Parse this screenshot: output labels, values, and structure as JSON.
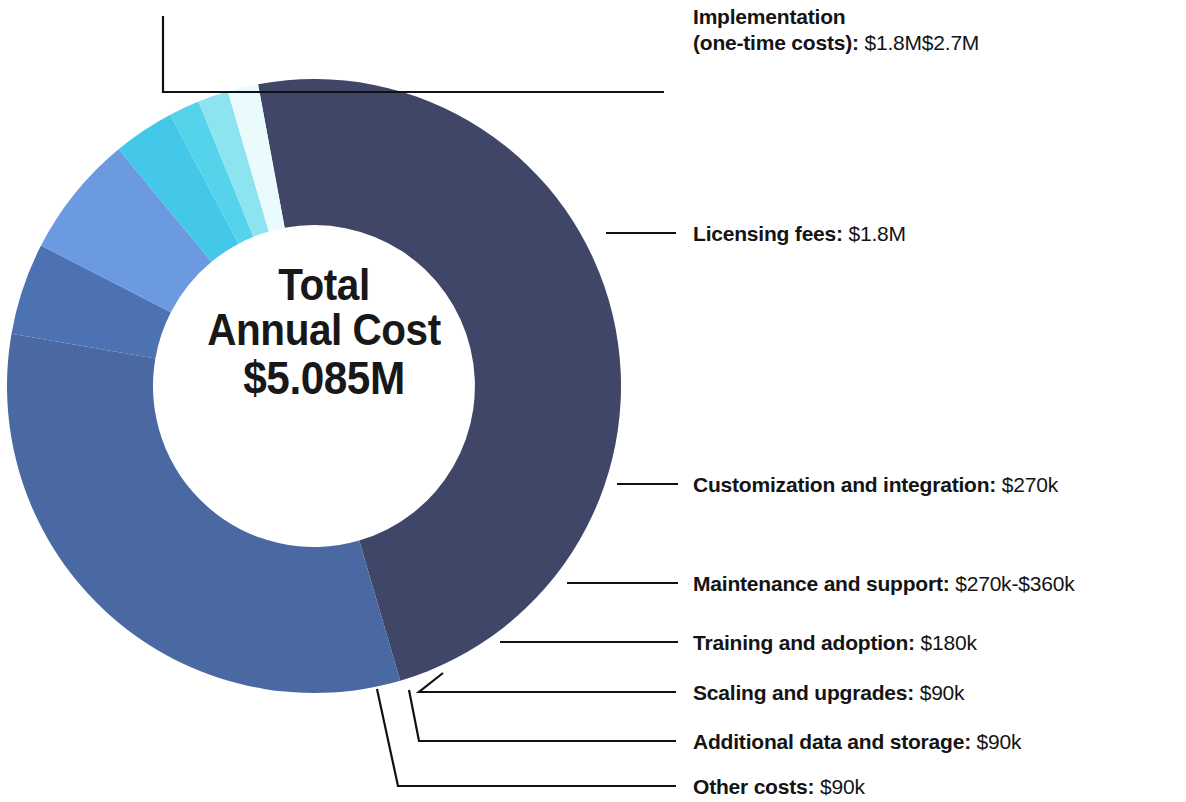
{
  "chart_data": {
    "type": "pie",
    "variant": "donut",
    "title": "Total Annual Cost",
    "center_label_line1": "Total",
    "center_label_line2": "Annual Cost",
    "center_value": "$5.085M",
    "total": 5.085,
    "total_unit": "M USD",
    "legend_position": "right-callouts",
    "grid": false,
    "categories": [
      "Implementation (one-time costs)",
      "Licensing fees",
      "Customization and integration",
      "Maintenance and support",
      "Training and adoption",
      "Scaling and upgrades",
      "Additional data and storage",
      "Other costs"
    ],
    "values": [
      2.7,
      1.8,
      0.27,
      0.36,
      0.18,
      0.09,
      0.09,
      0.09
    ],
    "value_labels": [
      "$1.8M$2.7M",
      "$1.8M",
      "$270k",
      "$270k-$360k",
      "$180k",
      "$90k",
      "$90k",
      "$90k"
    ],
    "colors": [
      "#3f4667",
      "#4a69a2",
      "#4c72b4",
      "#6b9ae0",
      "#43c8ea",
      "#55d3ea",
      "#8ce4f0",
      "#e9fbfd"
    ],
    "slices": [
      {
        "name": "Implementation (one-time costs)",
        "value_label": "$1.8M$2.7M",
        "value": 2.7,
        "percent": 53.1,
        "color": "#3f4667"
      },
      {
        "name": "Licensing fees",
        "value_label": "$1.8M",
        "value": 1.8,
        "percent": 35.4,
        "color": "#4a69a2"
      },
      {
        "name": "Customization and integration",
        "value_label": "$270k",
        "value": 0.27,
        "percent": 5.3,
        "color": "#4c72b4"
      },
      {
        "name": "Maintenance and support",
        "value_label": "$270k-$360k",
        "value": 0.36,
        "percent": 7.1,
        "color": "#6b9ae0"
      },
      {
        "name": "Training and adoption",
        "value_label": "$180k",
        "value": 0.18,
        "percent": 3.5,
        "color": "#43c8ea"
      },
      {
        "name": "Scaling and upgrades",
        "value_label": "$90k",
        "value": 0.09,
        "percent": 1.8,
        "color": "#55d3ea"
      },
      {
        "name": "Additional data and storage",
        "value_label": "$90k",
        "value": 0.09,
        "percent": 1.8,
        "color": "#8ce4f0"
      },
      {
        "name": "Other costs",
        "value_label": "$90k",
        "value": 0.09,
        "percent": 1.8,
        "color": "#e9fbfd"
      }
    ]
  },
  "callouts": {
    "implementation": {
      "label": "Implementation (one-time costs):",
      "label_line1": "Implementation",
      "label_line2": "(one-time costs):",
      "value": "$1.8M$2.7M"
    },
    "licensing": {
      "label": "Licensing fees:",
      "value": "$1.8M"
    },
    "customization": {
      "label": "Customization and integration:",
      "value": "$270k"
    },
    "maintenance": {
      "label": "Maintenance and support:",
      "value": "$270k-$360k"
    },
    "training": {
      "label": "Training and adoption:",
      "value": "$180k"
    },
    "scaling": {
      "label": "Scaling and upgrades:",
      "value": "$90k"
    },
    "additional_data": {
      "label": "Additional data and storage:",
      "value": "$90k"
    },
    "other": {
      "label": "Other costs:",
      "value": "$90k"
    }
  }
}
